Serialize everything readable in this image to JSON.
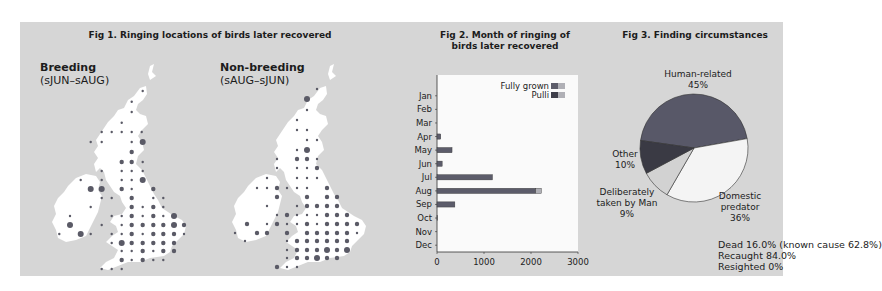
{
  "fig1": {
    "title": "Fig 1. Ringing locations of birds later recovered",
    "maps": [
      {
        "label": "Breeding",
        "period": "(sJUN–sAUG)"
      },
      {
        "label": "Non-breeding",
        "period": "(sAUG–sJUN)"
      }
    ]
  },
  "fig2": {
    "title_line1": "Fig 2. Month of ringing of",
    "title_line2": "birds later recovered"
  },
  "fig3": {
    "title": "Fig 3. Finding circumstances",
    "notes": [
      "Dead 16.0% (known cause 62.8%)",
      "Recaught 84.0%",
      "Resighted 0%"
    ]
  },
  "colors": {
    "panel": "#d6d6d6",
    "land": "#ffffff",
    "dot": "#5a5a66",
    "fully_grown": "#5c5c6a",
    "pulli": "#b0b0b6",
    "pie_human": "#585868",
    "pie_domestic": "#f4f4f4",
    "pie_deliberate": "#d2d2d2",
    "pie_other": "#3a3a44"
  },
  "chart_data": [
    {
      "type": "bar",
      "orientation": "horizontal",
      "title": "Fig 2. Month of ringing of birds later recovered",
      "categories": [
        "Jan",
        "Feb",
        "Mar",
        "Apr",
        "May",
        "Jun",
        "Jun2",
        "Jul",
        "Aug",
        "Sep",
        "Oct",
        "Nov",
        "Dec"
      ],
      "category_labels": [
        "Jan",
        "Feb",
        "Mar",
        "Apr",
        "May",
        "Jun",
        "Jul",
        "Aug",
        "Sep",
        "Oct",
        "Nov",
        "Dec"
      ],
      "series": [
        {
          "name": "Fully grown",
          "values": [
            0,
            0,
            0,
            80,
            320,
            100,
            1180,
            2100,
            380,
            10,
            0,
            0
          ]
        },
        {
          "name": "Pulli",
          "values": [
            0,
            0,
            0,
            0,
            0,
            0,
            0,
            120,
            0,
            0,
            0,
            0
          ]
        }
      ],
      "xlim": [
        0,
        3000
      ],
      "xticks": [
        "0",
        "1000",
        "2000",
        "3000"
      ],
      "legend": [
        "Fully grown",
        "Pulli"
      ],
      "legend_position": "top-right"
    },
    {
      "type": "pie",
      "title": "Fig 3. Finding circumstances",
      "slices": [
        {
          "label": "Human-related",
          "value": 45
        },
        {
          "label": "Domestic predator",
          "value": 36
        },
        {
          "label": "Deliberately taken by Man",
          "value": 9
        },
        {
          "label": "Other",
          "value": 10
        }
      ]
    }
  ],
  "bar_chart": {
    "months": [
      "Jan",
      "Feb",
      "Mar",
      "Apr",
      "May",
      "Jun",
      "Jul",
      "Aug",
      "Sep",
      "Oct",
      "Nov",
      "Dec"
    ],
    "fully_grown": [
      0,
      0,
      0,
      80,
      320,
      110,
      1180,
      2100,
      380,
      10,
      0,
      0
    ],
    "pulli": [
      0,
      0,
      0,
      0,
      0,
      0,
      0,
      120,
      0,
      0,
      0,
      0
    ],
    "xticks": [
      "0",
      "1000",
      "2000",
      "3000"
    ],
    "legend": {
      "fully_grown": "Fully grown",
      "pulli": "Pulli"
    }
  },
  "pie": {
    "labels": {
      "human": [
        "Human-related",
        "45%"
      ],
      "domestic": [
        "Domestic",
        "predator",
        "36%"
      ],
      "deliberate": [
        "Deliberately",
        "taken by Man",
        "9%"
      ],
      "other": [
        "Other",
        "10%"
      ]
    }
  }
}
